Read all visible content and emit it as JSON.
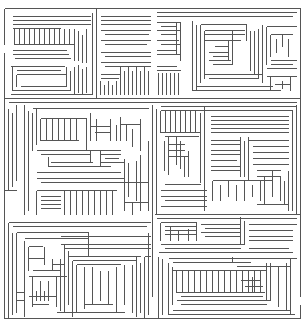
{
  "maze": {
    "width": 304,
    "height": 326,
    "background": "#ffffff",
    "wall_color": "#555555",
    "border": {
      "x1": 4,
      "y1": 8,
      "x2": 300,
      "y2": 318
    },
    "entrance": {
      "side": "left",
      "y": 48
    },
    "exit": {
      "side": "right",
      "y": 300
    },
    "sections": [
      {
        "name": "top-left-block",
        "x": 4,
        "y": 8,
        "w": 92,
        "h": 90
      },
      {
        "name": "top-middle-block",
        "x": 96,
        "y": 8,
        "w": 56,
        "h": 90
      },
      {
        "name": "top-right-block",
        "x": 152,
        "y": 8,
        "w": 148,
        "h": 90
      },
      {
        "name": "middle-left-block",
        "x": 4,
        "y": 104,
        "w": 150,
        "h": 110
      },
      {
        "name": "middle-right-block",
        "x": 154,
        "y": 104,
        "w": 146,
        "h": 95
      },
      {
        "name": "bottom-left-block",
        "x": 4,
        "y": 216,
        "w": 150,
        "h": 102
      },
      {
        "name": "bottom-right-block",
        "x": 154,
        "y": 216,
        "w": 146,
        "h": 102
      }
    ]
  }
}
